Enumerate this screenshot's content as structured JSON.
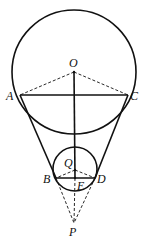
{
  "diagram": {
    "type": "geometry",
    "colors": {
      "stroke": "#111111",
      "background": "#ffffff"
    },
    "circles": [
      {
        "name": "large",
        "center": "O",
        "cx": 74,
        "cy": 72,
        "r": 62
      },
      {
        "name": "small",
        "center": "Q",
        "cx": 75,
        "cy": 169,
        "r": 22
      }
    ],
    "points": {
      "O": {
        "label": "O",
        "x": 74,
        "y": 72
      },
      "A": {
        "label": "A",
        "x": 20,
        "y": 95
      },
      "C": {
        "label": "C",
        "x": 128,
        "y": 95
      },
      "Q": {
        "label": "Q",
        "x": 75,
        "y": 170
      },
      "B": {
        "label": "B",
        "x": 56,
        "y": 178
      },
      "D": {
        "label": "D",
        "x": 95,
        "y": 178
      },
      "E": {
        "label": "E",
        "x": 75,
        "y": 178
      },
      "P": {
        "label": "P",
        "x": 74,
        "y": 223
      }
    },
    "segments_solid": [
      "AC",
      "BD",
      "OE",
      "AB",
      "CD"
    ],
    "segments_dashed": [
      "OA",
      "OC",
      "QB",
      "QD",
      "BP",
      "DP",
      "EP"
    ]
  }
}
